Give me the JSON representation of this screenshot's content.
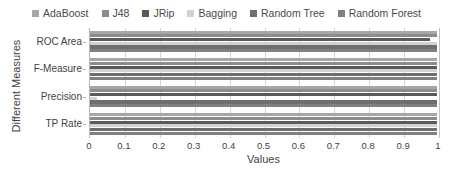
{
  "chart_data": {
    "type": "bar",
    "orientation": "horizontal",
    "title": "",
    "xlabel": "Values",
    "ylabel": "Different Measures",
    "categories": [
      "TP Rate",
      "Precision",
      "F-Measure",
      "ROC Area"
    ],
    "xlim": [
      0,
      1
    ],
    "xticks": [
      "0",
      "0.1",
      "0.2",
      "0.3",
      "0.4",
      "0.5",
      "0.6",
      "0.7",
      "0.8",
      "0.9",
      "1"
    ],
    "xtick_values": [
      0,
      0.1,
      0.2,
      0.3,
      0.4,
      0.5,
      0.6,
      0.7,
      0.8,
      0.9,
      1
    ],
    "grid": true,
    "legend_position": "top",
    "series": [
      {
        "name": "AdaBoost",
        "color": "#a6a6a6",
        "values": [
          0.995,
          0.995,
          0.995,
          0.995
        ]
      },
      {
        "name": "J48",
        "color": "#8c8c8c",
        "values": [
          0.995,
          0.995,
          0.995,
          0.995
        ]
      },
      {
        "name": "JRip",
        "color": "#5a5a5a",
        "values": [
          0.995,
          0.995,
          0.995,
          0.975
        ]
      },
      {
        "name": "Bagging",
        "color": "#d2d2d2",
        "values": [
          0.995,
          0.02,
          0.995,
          0.995
        ]
      },
      {
        "name": "Random Tree",
        "color": "#6e6e6e",
        "values": [
          0.995,
          0.995,
          0.995,
          0.995
        ]
      },
      {
        "name": "Random Forest",
        "color": "#808080",
        "values": [
          0.995,
          0.995,
          0.995,
          0.995
        ]
      }
    ]
  },
  "legend": {
    "items": [
      {
        "label": "AdaBoost"
      },
      {
        "label": "J48"
      },
      {
        "label": "JRip"
      },
      {
        "label": "Bagging"
      },
      {
        "label": "Random Tree"
      },
      {
        "label": "Random Forest"
      }
    ]
  },
  "axes": {
    "x_title": "Values",
    "y_title": "Different Measures"
  }
}
